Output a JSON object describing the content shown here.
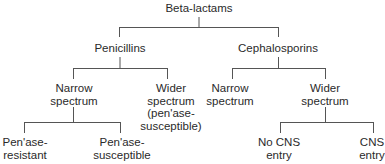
{
  "diagram": {
    "type": "tree",
    "line_color": "#555555",
    "root": "Beta-lactams",
    "level1": {
      "penicillins": "Penicillins",
      "cephalosporins": "Cephalosporins"
    },
    "level2": {
      "pen_narrow_1": "Narrow",
      "pen_narrow_2": "spectrum",
      "pen_wider_1": "Wider",
      "pen_wider_2": "spectrum",
      "pen_wider_3": "(pen'ase-",
      "pen_wider_4": "susceptible)",
      "ceph_narrow_1": "Narrow",
      "ceph_narrow_2": "spectrum",
      "ceph_wider_1": "Wider",
      "ceph_wider_2": "spectrum"
    },
    "level3": {
      "resistant_1": "Pen'ase-",
      "resistant_2": "resistant",
      "susceptible_1": "Pen'ase-",
      "susceptible_2": "susceptible",
      "no_cns_1": "No CNS",
      "no_cns_2": "entry",
      "cns_1": "CNS",
      "cns_2": "entry"
    }
  }
}
